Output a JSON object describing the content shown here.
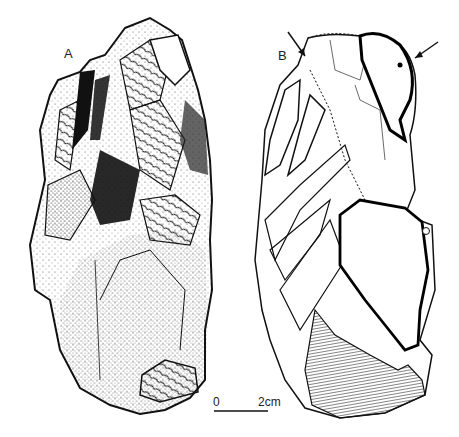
{
  "figure": {
    "views": [
      {
        "id": "A",
        "label": "A",
        "rendering": "stippled shaded drawing of flaked stone core"
      },
      {
        "id": "B",
        "label": "B",
        "rendering": "line diagram of flake scars with arrows, dot and circle markers, hatched cortex area"
      }
    ],
    "scale_bar": {
      "start_label": "0",
      "end_label": "2cm"
    },
    "markers": {
      "arrows": 2,
      "dot": "solid dot",
      "circle": "open circle"
    },
    "colors": {
      "ink": "#111111",
      "background": "#ffffff",
      "hatch": "#555555"
    }
  }
}
